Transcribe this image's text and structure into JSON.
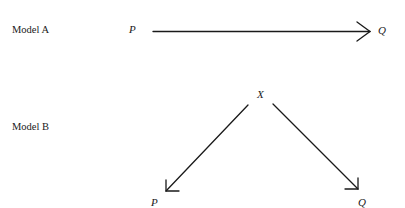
{
  "models": [
    {
      "label": "Model A",
      "nodes": {
        "cause": "P",
        "effect": "Q"
      },
      "edges": [
        {
          "from": "P",
          "to": "Q"
        }
      ]
    },
    {
      "label": "Model B",
      "nodes": {
        "common_cause": "X",
        "left": "P",
        "right": "Q"
      },
      "edges": [
        {
          "from": "X",
          "to": "P"
        },
        {
          "from": "X",
          "to": "Q"
        }
      ]
    }
  ],
  "colors": {
    "ink": "#1a1a1a",
    "background": "#ffffff"
  }
}
